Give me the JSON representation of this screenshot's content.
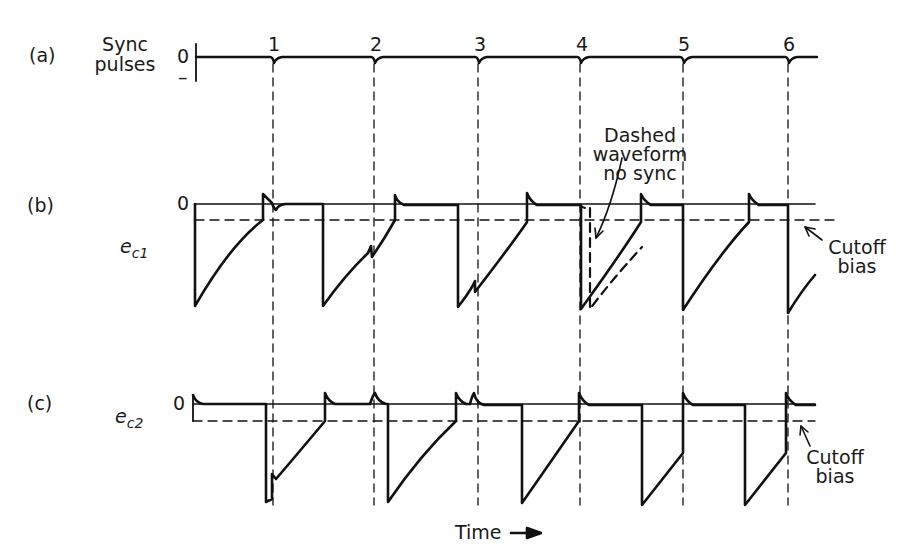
{
  "panels": {
    "a": {
      "tag": "(a)",
      "title_line1": "Sync",
      "title_line2": "pulses",
      "zero": "0",
      "minus": "–"
    },
    "b": {
      "tag": "(b)",
      "signal": "e",
      "signal_sub": "c1",
      "zero": "0"
    },
    "c": {
      "tag": "(c)",
      "signal": "e",
      "signal_sub": "c2",
      "zero": "0"
    }
  },
  "sync_numbers": [
    "1",
    "2",
    "3",
    "4",
    "5",
    "6"
  ],
  "annotations": {
    "dashed_line1": "Dashed",
    "dashed_line2": "waveform",
    "dashed_line3": "no sync",
    "cutoff_b_line1": "Cutoff",
    "cutoff_b_line2": "bias",
    "cutoff_c_line1": "Cutoff",
    "cutoff_c_line2": "bias"
  },
  "xaxis": {
    "label": "Time",
    "arrow": "→"
  },
  "colors": {
    "ink": "#111111",
    "background": "#ffffff"
  }
}
